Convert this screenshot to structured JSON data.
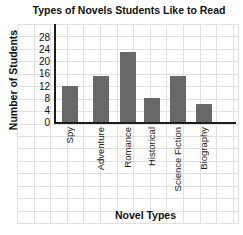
{
  "chart_data": {
    "type": "bar",
    "title": "Types of Novels Students Like to Read",
    "xlabel": "Novel Types",
    "ylabel": "Number of Students",
    "categories": [
      "Spy",
      "Adventure",
      "Romance",
      "Historical",
      "Science Fiction",
      "Biography"
    ],
    "values": [
      12,
      15,
      23,
      8,
      15,
      6
    ],
    "yticks": [
      28,
      24,
      20,
      16,
      12,
      8,
      4,
      0
    ],
    "ylim": [
      0,
      32
    ],
    "ytick_step": 4,
    "grid": "on",
    "legend": "none",
    "bar_color": "#686868",
    "grid_color": "#e3e0e0",
    "axis_color": "#1c1c1c"
  }
}
